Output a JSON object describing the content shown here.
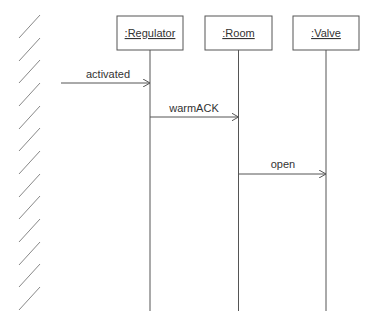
{
  "diagram": {
    "type": "uml-sequence",
    "colors": {
      "line": "#555555",
      "text": "#333333",
      "hatch": "#888888",
      "background": "#ffffff"
    },
    "actor_boundary": {
      "style": "hatched-wall",
      "hatch_count": 13
    },
    "lifelines": [
      {
        "id": "regulator",
        "label": ":Regulator"
      },
      {
        "id": "room",
        "label": ":Room"
      },
      {
        "id": "valve",
        "label": ":Valve"
      }
    ],
    "messages": [
      {
        "from": "environment",
        "to": "regulator",
        "label": "activated"
      },
      {
        "from": "regulator",
        "to": "room",
        "label": "warmACK"
      },
      {
        "from": "room",
        "to": "valve",
        "label": "open"
      }
    ]
  }
}
